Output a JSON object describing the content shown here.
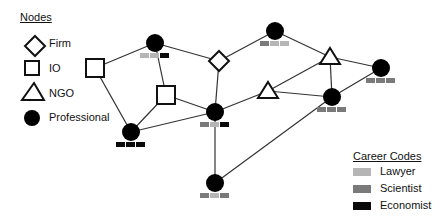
{
  "legend_nodes": {
    "title": "Nodes",
    "items": [
      {
        "shape": "diamond",
        "label": "Firm"
      },
      {
        "shape": "square",
        "label": "IO"
      },
      {
        "shape": "triangle",
        "label": "NGO"
      },
      {
        "shape": "circle",
        "label": "Professional"
      }
    ]
  },
  "legend_careers": {
    "title": "Career Codes",
    "items": [
      {
        "label": "Lawyer",
        "color": "#b5b5b5"
      },
      {
        "label": "Scientist",
        "color": "#7a7a7a"
      },
      {
        "label": "Economist",
        "color": "#0a0a0a"
      }
    ]
  },
  "colors": {
    "lawyer": "#b5b5b5",
    "scientist": "#7a7a7a",
    "economist": "#0a0a0a"
  },
  "nodes": [
    {
      "id": "P1",
      "type": "professional",
      "x": 155,
      "y": 43,
      "careers": [
        "lawyer",
        "lawyer",
        "economist"
      ]
    },
    {
      "id": "P2",
      "type": "professional",
      "x": 275,
      "y": 31,
      "careers": [
        "scientist",
        "lawyer",
        "lawyer"
      ]
    },
    {
      "id": "P3",
      "type": "professional",
      "x": 381,
      "y": 68,
      "careers": [
        "scientist",
        "scientist",
        "scientist"
      ]
    },
    {
      "id": "P4",
      "type": "professional",
      "x": 332,
      "y": 97,
      "careers": [
        "scientist",
        "scientist",
        "scientist"
      ]
    },
    {
      "id": "P5",
      "type": "professional",
      "x": 215,
      "y": 112,
      "careers": [
        "scientist",
        "lawyer",
        "economist"
      ]
    },
    {
      "id": "P6",
      "type": "professional",
      "x": 131,
      "y": 132,
      "careers": [
        "economist",
        "economist",
        "economist"
      ]
    },
    {
      "id": "P7",
      "type": "professional",
      "x": 215,
      "y": 183,
      "careers": [
        "scientist",
        "lawyer",
        "scientist"
      ]
    },
    {
      "id": "F1",
      "type": "firm",
      "x": 219,
      "y": 61
    },
    {
      "id": "I1",
      "type": "io",
      "x": 95,
      "y": 68
    },
    {
      "id": "I2",
      "type": "io",
      "x": 166,
      "y": 95
    },
    {
      "id": "N1",
      "type": "ngo",
      "x": 330,
      "y": 57
    },
    {
      "id": "N2",
      "type": "ngo",
      "x": 268,
      "y": 91
    }
  ],
  "edges": [
    [
      "I1",
      "P1"
    ],
    [
      "P1",
      "F1"
    ],
    [
      "P1",
      "I2"
    ],
    [
      "I1",
      "P6"
    ],
    [
      "P6",
      "I2"
    ],
    [
      "P6",
      "P5"
    ],
    [
      "I2",
      "P5"
    ],
    [
      "F1",
      "P5"
    ],
    [
      "F1",
      "P2"
    ],
    [
      "P2",
      "N1"
    ],
    [
      "N1",
      "P3"
    ],
    [
      "N1",
      "N2"
    ],
    [
      "N1",
      "P4"
    ],
    [
      "P4",
      "P3"
    ],
    [
      "N2",
      "P4"
    ],
    [
      "P5",
      "N2"
    ],
    [
      "P5",
      "P7"
    ],
    [
      "P7",
      "P4"
    ]
  ]
}
